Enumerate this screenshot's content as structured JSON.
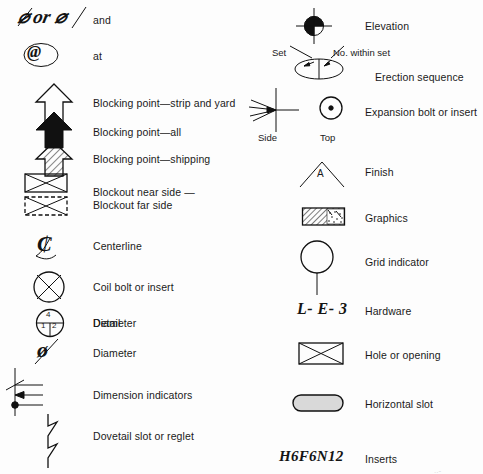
{
  "sheet": {
    "title": "Architectural precast concrete drafting symbols legend",
    "columns": 2,
    "background_color": "#fdfdfd",
    "ink_color": "#111111"
  },
  "left_column": [
    {
      "id": "and",
      "symbol_name": "and-glyph",
      "symbol_text": "⌀ or ⌀",
      "symbol_kind": "handwritten",
      "label": "and"
    },
    {
      "id": "at",
      "symbol_name": "at-glyph",
      "symbol_text": "@",
      "symbol_kind": "handwritten-circled",
      "label": "at"
    },
    {
      "id": "blocking-strip-yard",
      "symbol_name": "open-arrow-up",
      "symbol_kind": "outline-arrow",
      "label": "Blocking point—strip and yard"
    },
    {
      "id": "blocking-all",
      "symbol_name": "filled-arrow-up",
      "symbol_kind": "solid-arrow",
      "label": "Blocking point—all"
    },
    {
      "id": "blocking-shipping",
      "symbol_name": "hatched-arrow-up",
      "symbol_kind": "hatched-arrow",
      "label": "Blocking point—shipping"
    },
    {
      "id": "blockout",
      "symbol_name": "blockout-rectangles",
      "symbol_kind": "rect-with-x-solid-and-dashed",
      "label": "Blockout near side —\nBlockout far side"
    },
    {
      "id": "centerline",
      "symbol_name": "centerline-glyph",
      "symbol_text": "₵",
      "symbol_kind": "handwritten",
      "label": "Centerline"
    },
    {
      "id": "coil-bolt",
      "symbol_name": "circle-with-x",
      "symbol_kind": "circle-crossed",
      "label": "Coil bolt or insert"
    },
    {
      "id": "detail",
      "symbol_name": "detail-circle",
      "symbol_kind": "circle-quadrants-numbered",
      "quadrant_top": "4",
      "quadrant_bottom_left": "1",
      "quadrant_bottom_right": "2",
      "label": "Detail"
    },
    {
      "id": "diameter",
      "symbol_name": "diameter-glyph",
      "symbol_text": "ø",
      "symbol_kind": "handwritten",
      "label": "Diameter"
    },
    {
      "id": "dimension-indicators",
      "symbol_name": "dimension-indicator-lines",
      "symbol_kind": "three-terminator-lines",
      "terminators": [
        "slash-tick",
        "arrowhead",
        "filled-dot"
      ],
      "label": "Dimension indicators"
    },
    {
      "id": "dovetail",
      "symbol_name": "dovetail-zigzag",
      "symbol_kind": "zigzag-line",
      "label": "Dovetail slot or reglet"
    }
  ],
  "right_column": [
    {
      "id": "elevation",
      "symbol_name": "elevation-target",
      "symbol_kind": "crosshair-circle-half-filled",
      "label": "Elevation"
    },
    {
      "id": "erection-sequence",
      "symbol_name": "erection-sequence-ellipse",
      "symbol_kind": "split-ellipse-with-leaders",
      "callout_left": "Set",
      "callout_right": "No. within set",
      "label": "Erection sequence"
    },
    {
      "id": "expansion-bolt",
      "symbol_name": "expansion-bolt-views",
      "symbol_kind": "side-and-top-views",
      "view_left_label": "Side",
      "view_right_label": "Top",
      "label": "Expansion bolt or insert"
    },
    {
      "id": "finish",
      "symbol_name": "finish-caret",
      "symbol_kind": "caret-with-letter",
      "letter": "A",
      "label": "Finish"
    },
    {
      "id": "graphics",
      "symbol_name": "graphics-hatched-box",
      "symbol_kind": "rect-hatched-and-stippled",
      "label": "Graphics"
    },
    {
      "id": "grid-indicator",
      "symbol_name": "grid-indicator-balloon",
      "symbol_kind": "circle-with-stem",
      "label": "Grid indicator"
    },
    {
      "id": "hardware",
      "symbol_name": "hardware-glyph",
      "symbol_text": "L- E- 3",
      "symbol_kind": "handwritten",
      "label": "Hardware"
    },
    {
      "id": "hole-opening",
      "symbol_name": "hole-rectangle-with-x",
      "symbol_kind": "rect-with-x",
      "label": "Hole or opening"
    },
    {
      "id": "horizontal-slot",
      "symbol_name": "horizontal-slot-capsule",
      "symbol_kind": "filled-capsule",
      "label": "Horizontal slot"
    },
    {
      "id": "inserts",
      "symbol_name": "inserts-glyph",
      "symbol_text": "H6F6N12",
      "symbol_kind": "handwritten",
      "label": "Inserts"
    }
  ]
}
